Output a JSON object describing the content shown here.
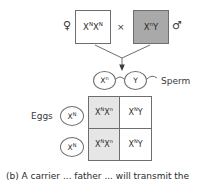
{
  "diagram": {
    "title_caption": "(b) A carrier ... father ... will transmit the",
    "cross_symbol": "×",
    "parents": {
      "female": {
        "sex_symbol": "♀",
        "sex_name": "female",
        "allele1": "X",
        "allele1_sup": "N",
        "allele2": "X",
        "allele2_sup": "N",
        "box_color": "#ffffff"
      },
      "male": {
        "sex_symbol": "♂",
        "sex_name": "male",
        "allele1": "X",
        "allele1_sup": "n",
        "allele2": "Y",
        "allele2_sup": "",
        "box_color": "#a9a9a9"
      }
    },
    "gametes": {
      "sperm_label": "Sperm",
      "eggs_label": "Eggs",
      "sperm": [
        {
          "allele": "X",
          "sup": "n"
        },
        {
          "allele": "Y",
          "sup": ""
        }
      ],
      "eggs": [
        {
          "allele": "X",
          "sup": "N"
        },
        {
          "allele": "X",
          "sup": "N"
        }
      ]
    },
    "punnett": {
      "cells": [
        {
          "text": "X",
          "sup1": "N",
          "text2": "X",
          "sup2": "n",
          "shaded": true
        },
        {
          "text": "X",
          "sup1": "N",
          "text2": "Y",
          "sup2": "",
          "shaded": false
        },
        {
          "text": "X",
          "sup1": "N",
          "text2": "X",
          "sup2": "n",
          "shaded": true
        },
        {
          "text": "X",
          "sup1": "N",
          "text2": "Y",
          "sup2": "",
          "shaded": false
        }
      ]
    },
    "colors": {
      "line": "#6e6e6e",
      "text": "#2b2b2b",
      "shaded_cell": "#e6e6e6",
      "male_box": "#a9a9a9"
    }
  }
}
